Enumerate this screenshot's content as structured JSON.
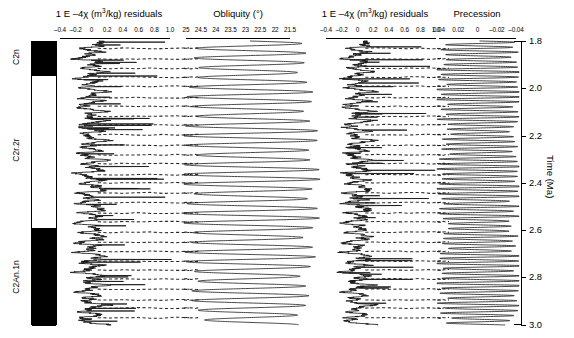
{
  "figure": {
    "kind": "cyclostratigraphy-correlation-figure",
    "background": "#ffffff",
    "line_color": "#1a1a1a"
  },
  "magnetostratigraphy": {
    "name": "magnetic-polarity-column",
    "chrons": [
      {
        "label": "C2n",
        "polarity": "normal",
        "fill": "#000000",
        "t_top": 1.8,
        "t_base": 1.945
      },
      {
        "label": "C2r.2r",
        "polarity": "reverse",
        "fill": "#ffffff",
        "t_top": 1.945,
        "t_base": 2.585
      },
      {
        "label": "C2An.1n",
        "polarity": "normal",
        "fill": "#000000",
        "t_top": 2.585,
        "t_base": 3.0
      }
    ]
  },
  "time_axis": {
    "label": "Time (Ma)",
    "min": 1.8,
    "max": 3.0,
    "tick_values": [
      1.8,
      2.0,
      2.2,
      2.4,
      2.6,
      2.8,
      3.0
    ],
    "tick_labels": [
      "1.8",
      "2.0",
      "2.2",
      "2.4",
      "2.6",
      "2.8",
      "3.0"
    ],
    "direction": "increasing-downward"
  },
  "panels": [
    {
      "id": "susceptibility-residuals-left",
      "title_prefix": "1 E –4χ (m",
      "title_sup": "3",
      "title_suffix": "/kg) residuals",
      "title_plain": "1 E –4χ (m3/kg) residuals",
      "xlabel": "1 E –4χ (m3/kg) residuals",
      "tick_labels": [
        "–0.4",
        "–0.2",
        "0",
        "0.2",
        "0.4",
        "0.6",
        "0.8",
        "1.0"
      ],
      "tick_values": [
        -0.4,
        -0.2,
        0,
        0.2,
        0.4,
        0.6,
        0.8,
        1.0
      ],
      "xlim": [
        -0.5,
        1.1
      ],
      "series_name": "magnetic susceptibility residuals",
      "tie_lines": "horizontal dashed correlation lines"
    },
    {
      "id": "obliquity",
      "title_prefix": "Obliquity (°)",
      "title_sup": "",
      "title_suffix": "",
      "title_plain": "Obliquity (°)",
      "xlabel": "Obliquity (°)",
      "tick_labels": [
        "25",
        "24.5",
        "24",
        "23.5",
        "23",
        "22.5",
        "22",
        "21.5"
      ],
      "tick_values": [
        25,
        24.5,
        24,
        23.5,
        23,
        22.5,
        22,
        21.5
      ],
      "xlim": [
        25.2,
        21.3
      ],
      "series_name": "obliquity solution",
      "tie_lines": "horizontal dashed correlation lines"
    },
    {
      "id": "susceptibility-residuals-right",
      "title_prefix": "1 E –4χ (m",
      "title_sup": "3",
      "title_suffix": "/kg) residuals",
      "title_plain": "1 E –4χ (m3/kg) residuals",
      "xlabel": "1 E –4χ (m3/kg) residuals",
      "tick_labels": [
        "–0.4",
        "–0.2",
        "0",
        "0.2",
        "0.4",
        "0.6",
        "0.8",
        "1.0"
      ],
      "tick_values": [
        -0.4,
        -0.2,
        0,
        0.2,
        0.4,
        0.6,
        0.8,
        1.0
      ],
      "xlim": [
        -0.5,
        1.1
      ],
      "series_name": "magnetic susceptibility residuals",
      "tie_lines": "horizontal dashed correlation lines"
    },
    {
      "id": "precession",
      "title_prefix": "Precession",
      "title_sup": "",
      "title_suffix": "",
      "title_plain": "Precession",
      "xlabel": "Precession",
      "tick_labels": [
        "0.04",
        "0.02",
        "0",
        "–0.02",
        "–0.04"
      ],
      "tick_values": [
        0.04,
        0.02,
        0,
        -0.02,
        -0.04
      ],
      "xlim": [
        0.05,
        -0.05
      ],
      "series_name": "precession index solution",
      "tie_lines": "horizontal dashed correlation lines"
    }
  ],
  "chart_data": {
    "type": "line",
    "orientation": "vertical-time-series",
    "title": "",
    "ylabel": "Time (Ma)",
    "ylim": [
      1.8,
      3.0
    ],
    "grid": false,
    "legend": "none",
    "panel_count": 4,
    "panels": [
      {
        "name": "1 E –4χ (m3/kg) residuals",
        "xlim": [
          -0.5,
          1.1
        ],
        "xticks": [
          -0.4,
          -0.2,
          0,
          0.2,
          0.4,
          0.6,
          0.8,
          1.0
        ],
        "amplitude_mean": 0.12,
        "amplitude_peak": 1.0,
        "dominant_period_kyr": 41,
        "n_tie_lines": 29
      },
      {
        "name": "Obliquity (°)",
        "xlim": [
          25.2,
          21.3
        ],
        "xticks": [
          25,
          24.5,
          24,
          23.5,
          23,
          22.5,
          22,
          21.5
        ],
        "mean": 23.3,
        "amplitude_deg": 1.3,
        "dominant_period_kyr": 41,
        "n_tie_lines": 29
      },
      {
        "name": "1 E –4χ (m3/kg) residuals",
        "xlim": [
          -0.5,
          1.1
        ],
        "xticks": [
          -0.4,
          -0.2,
          0,
          0.2,
          0.4,
          0.6,
          0.8,
          1.0
        ],
        "amplitude_mean": 0.12,
        "amplitude_peak": 1.0,
        "dominant_period_kyr": 21,
        "n_tie_lines": 29
      },
      {
        "name": "Precession",
        "xlim": [
          0.05,
          -0.05
        ],
        "xticks": [
          0.04,
          0.02,
          0,
          -0.02,
          -0.04
        ],
        "mean": 0.0,
        "amplitude": 0.045,
        "dominant_period_kyr": 21,
        "n_tie_lines": 29
      }
    ]
  }
}
